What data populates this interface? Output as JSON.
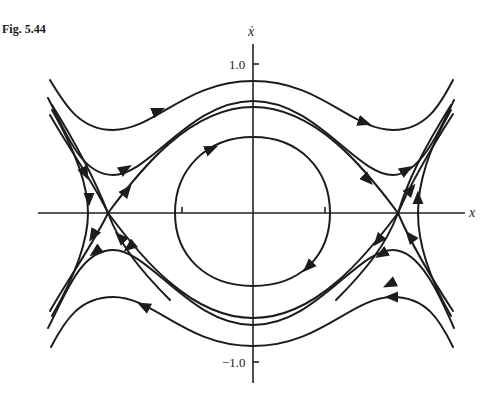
{
  "figure": {
    "label": "Fig. 5.44",
    "x_axis_label": "x",
    "y_axis_label": "ẋ",
    "y_tick_top": "1.0",
    "y_tick_bottom": "−1.0"
  },
  "diagram": {
    "type": "phase-portrait",
    "axes": {
      "x": "x",
      "y": "x-dot"
    },
    "equilibria": [
      {
        "kind": "center",
        "position": "origin"
      },
      {
        "kind": "saddle",
        "position": "left, on x-axis"
      },
      {
        "kind": "saddle",
        "position": "right, on x-axis"
      }
    ],
    "trajectories": [
      "closed orbit around origin (clockwise)",
      "upper open trajectory above separatrix (left to right)",
      "lower open trajectory below separatrix (right to left)",
      "heteroclinic separatrices joining the saddles",
      "outer trajectories left and right of saddles"
    ],
    "colors": {
      "ink": "#1c1c1c",
      "background": "#ffffff"
    }
  }
}
